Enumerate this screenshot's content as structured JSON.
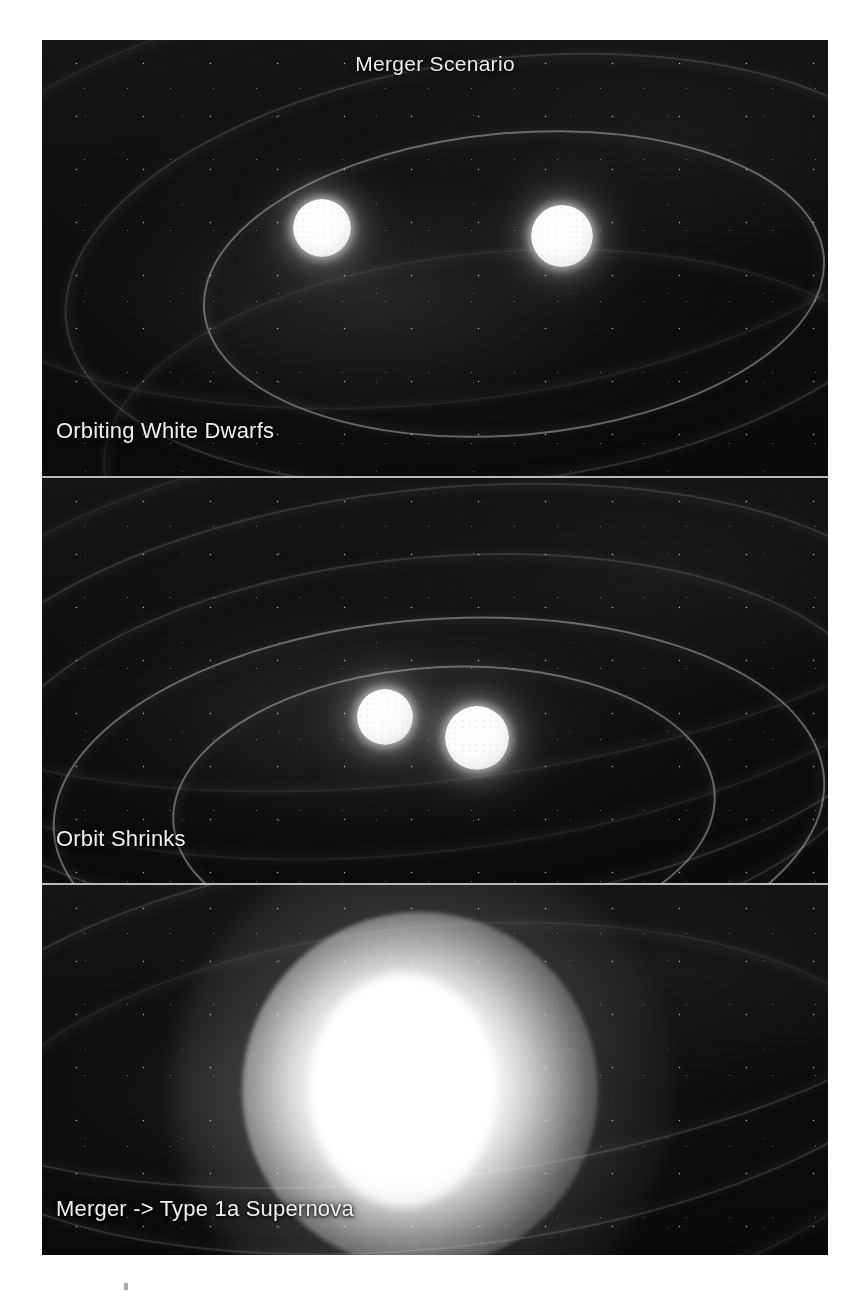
{
  "figure": {
    "title": "Merger Scenario",
    "background_color": "#0a0a0a",
    "page_background": "#ffffff",
    "text_color": "#f0f0f0",
    "panels": [
      {
        "id": "panel-1",
        "caption": "Orbiting White Dwarfs",
        "description": "Two white dwarf stars separated on a wide elliptical orbit, surrounded by faint gravitational wave ripples",
        "stars": [
          {
            "name": "white-dwarf-left",
            "cx": 280,
            "cy": 188,
            "r": 29
          },
          {
            "name": "white-dwarf-right",
            "cx": 520,
            "cy": 196,
            "r": 31
          }
        ]
      },
      {
        "id": "panel-2",
        "caption": "Orbit Shrinks",
        "description": "The two white dwarfs have spiralled closer together as concentric gravitational wave rings carry away orbital energy",
        "stars": [
          {
            "name": "white-dwarf-left",
            "cx": 343,
            "cy": 239,
            "r": 28
          },
          {
            "name": "white-dwarf-right",
            "cx": 435,
            "cy": 260,
            "r": 32
          }
        ]
      },
      {
        "id": "panel-3",
        "caption": "Merger -> Type 1a Supernova",
        "description": "The merged white dwarfs detonate as a brilliant Type 1a supernova filling most of the frame",
        "explosion": {
          "name": "supernova-blast",
          "cx": 378,
          "cy": 205,
          "r": 178
        }
      }
    ]
  },
  "artifact": {
    "label": "scan-smudge"
  }
}
